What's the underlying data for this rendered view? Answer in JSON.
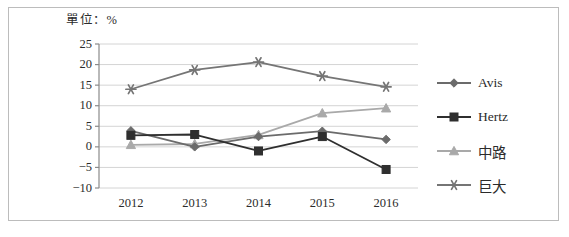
{
  "chart_data": {
    "type": "line",
    "title": "單位：%",
    "xlabel": "",
    "ylabel": "",
    "categories": [
      "2012",
      "2013",
      "2014",
      "2015",
      "2016"
    ],
    "ylim": [
      -10,
      25
    ],
    "yticks": [
      25,
      20,
      15,
      10,
      5,
      0,
      -5,
      -10
    ],
    "ytick_labels": [
      "25",
      "20",
      "15",
      "10",
      "5",
      "0",
      "-5",
      "-10"
    ],
    "grid": true,
    "legend_position": "right",
    "series": [
      {
        "name": "Avis",
        "marker": "diamond",
        "color": "#6b6b6b",
        "values": [
          3.9,
          0.0,
          2.5,
          3.8,
          1.8
        ]
      },
      {
        "name": "Hertz",
        "marker": "square",
        "color": "#2f2f2f",
        "values": [
          2.8,
          3.0,
          -1.0,
          2.5,
          -5.5
        ]
      },
      {
        "name": "中路",
        "marker": "triangle",
        "color": "#a9a9a9",
        "values": [
          0.5,
          0.7,
          2.9,
          8.2,
          9.4
        ]
      },
      {
        "name": "巨大",
        "marker": "asterisk",
        "color": "#757575",
        "values": [
          14.0,
          18.7,
          20.6,
          17.2,
          14.6
        ]
      }
    ]
  },
  "colors": {
    "frame": "#bcbcbc",
    "grid": "#d4d4d4",
    "axis": "#8a8a8a",
    "text": "#2b2b2b",
    "background": "#ffffff"
  }
}
